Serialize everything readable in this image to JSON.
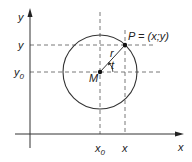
{
  "diagram": {
    "type": "circle-in-coordinate-system",
    "colors": {
      "stroke": "#333333",
      "dash": "#555555",
      "background": "#ffffff"
    },
    "axes": {
      "x_axis_label": "x",
      "y_axis_label": "y"
    },
    "ticks": {
      "x_ticks": [
        {
          "label": "x",
          "sub": "0"
        },
        {
          "label": "x",
          "sub": ""
        }
      ],
      "y_ticks": [
        {
          "label": "y",
          "sub": ""
        },
        {
          "label": "y",
          "sub": "0"
        }
      ]
    },
    "points": {
      "center_label": "M",
      "point_label": "P = (x;y)"
    },
    "annotations": {
      "radius_label": "r",
      "angle_label": "t"
    }
  }
}
